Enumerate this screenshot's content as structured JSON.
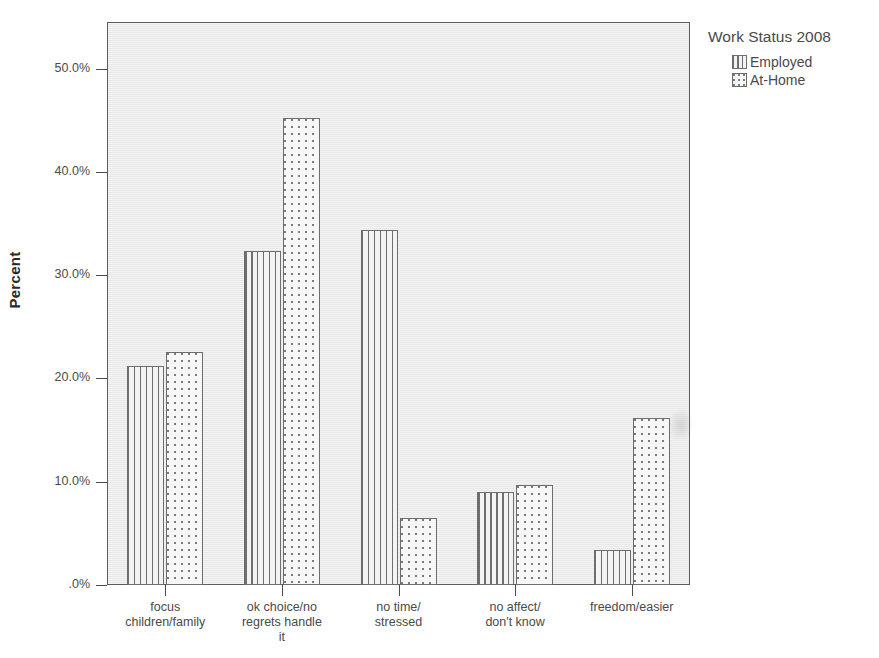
{
  "chart_data": {
    "type": "bar",
    "title": "",
    "xlabel": "",
    "ylabel": "Percent",
    "ylim": [
      0,
      53
    ],
    "grid": false,
    "legend_position": "right",
    "legend_title": "Work Status 2008",
    "categories": [
      "focus\nchildren/family",
      "ok choice/no\nregrets handle\nit",
      "no time/\nstressed",
      "no affect/\ndon't know",
      "freedom/easier"
    ],
    "ytick_labels": [
      ".0%",
      "10.0%",
      "20.0%",
      "30.0%",
      "40.0%",
      "50.0%"
    ],
    "ytick_values": [
      0,
      10,
      20,
      30,
      40,
      50
    ],
    "series": [
      {
        "name": "Employed",
        "pattern": "vertical-lines",
        "values": [
          21.2,
          32.3,
          34.4,
          9.0,
          3.4
        ]
      },
      {
        "name": "At-Home",
        "pattern": "dotted",
        "values": [
          22.6,
          45.2,
          6.5,
          9.7,
          16.2
        ]
      }
    ]
  },
  "legend": {
    "title": "Work Status 2008",
    "items": [
      {
        "label": "Employed",
        "pattern": "vertical-lines"
      },
      {
        "label": "At-Home",
        "pattern": "dotted"
      }
    ]
  },
  "axes": {
    "y_title": "Percent"
  },
  "colors": {
    "plot_background": "#ececec",
    "axis_line": "#4a4a4a",
    "bar_outline": "#6d6d6d",
    "bar_fill": "#f3f3f3",
    "text": "#4a4a4a"
  }
}
